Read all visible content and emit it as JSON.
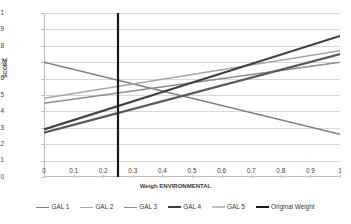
{
  "axes": {
    "x_title": "Weigh ENVIRONMENTAL",
    "y_title": "SCORE",
    "x_ticks": [
      "0",
      "0.1",
      "0.2",
      "0.3",
      "0.4",
      "0.5",
      "0.6",
      "0.7",
      "0.8",
      "0.9",
      "1"
    ],
    "y_ticks": [
      "1",
      "0.9",
      "0.8",
      "0.7",
      "0.6",
      "0.5",
      "0.4",
      "0.3",
      "0.2",
      "0.1",
      "0"
    ]
  },
  "legend": {
    "items": [
      {
        "label": "GAL 1",
        "color": "#808080"
      },
      {
        "label": "GAL 2",
        "color": "#a6a6a6"
      },
      {
        "label": "GAL 3",
        "color": "#8c8c8c"
      },
      {
        "label": "GAL 4",
        "color": "#404040"
      },
      {
        "label": "GAL 5",
        "color": "#bfbfbf"
      },
      {
        "label": "Original Weight",
        "color": "#1a1a1a"
      }
    ]
  },
  "chart_data": {
    "type": "line",
    "title": "",
    "xlabel": "Weigh ENVIRONMENTAL",
    "ylabel": "SCORE",
    "xlim": [
      0,
      1
    ],
    "ylim": [
      0,
      1
    ],
    "grid": true,
    "legend_position": "bottom",
    "x": [
      0,
      1
    ],
    "series": [
      {
        "name": "GAL 1",
        "values": [
          0.7,
          0.26
        ],
        "color": "#808080",
        "width": 1.5
      },
      {
        "name": "GAL 2",
        "values": [
          0.48,
          0.77
        ],
        "color": "#a6a6a6",
        "width": 1.5
      },
      {
        "name": "GAL 3",
        "values": [
          0.45,
          0.7
        ],
        "color": "#8c8c8c",
        "width": 1.5
      },
      {
        "name": "GAL 4",
        "values": [
          0.29,
          0.86
        ],
        "color": "#404040",
        "width": 2.2
      },
      {
        "name": "GAL 5",
        "values": [
          0.27,
          0.75
        ],
        "color": "#595959",
        "width": 2.2
      }
    ],
    "annotations": [
      {
        "name": "Original Weight",
        "type": "vertical-line",
        "x": 0.25,
        "y_from": 0,
        "y_to": 1,
        "color": "#1a1a1a",
        "width": 2.2
      }
    ]
  }
}
